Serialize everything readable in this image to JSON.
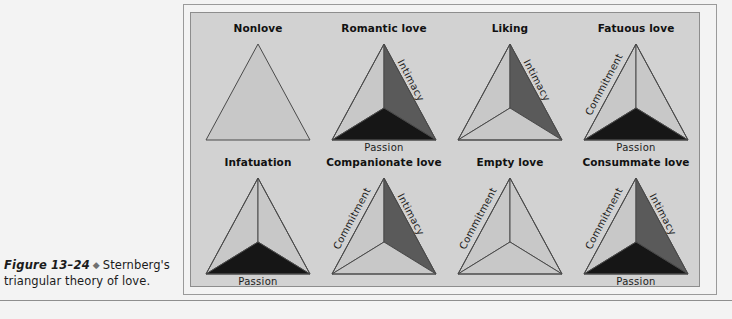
{
  "figure": {
    "caption_label": "Figure 13–24",
    "caption_diamond": "◆",
    "caption_text": "Sternberg's triangular theory of love.",
    "title": "Sternberg's triangular theory of love"
  },
  "colors": {
    "page_background": "#f3f3f3",
    "panel_background": "#d2d2d2",
    "panel_border": "#8d8d8d",
    "outer_frame_border": "#9a9a9a",
    "triangle_stroke": "#4a4a4a",
    "fill_empty": "#c8c8c8",
    "fill_intimacy": "#5a5a5a",
    "fill_passion": "#161616",
    "fill_commitment": "#c8c8c8",
    "label_text": "#1d1d1d",
    "title_text": "#111111",
    "rule": "#8e8e8e"
  },
  "components": {
    "passion": "Passion",
    "intimacy": "Intimacy",
    "commitment": "Commitment"
  },
  "triangles": [
    {
      "id": "nonlove",
      "label": "Nonlove",
      "row": 0,
      "col": 0,
      "passion": false,
      "intimacy": false,
      "commitment": false,
      "show_subdivision": false,
      "labels": []
    },
    {
      "id": "romantic-love",
      "label": "Romantic love",
      "row": 0,
      "col": 1,
      "passion": true,
      "intimacy": true,
      "commitment": false,
      "show_subdivision": true,
      "labels": [
        "Intimacy",
        "Passion"
      ]
    },
    {
      "id": "liking",
      "label": "Liking",
      "row": 0,
      "col": 2,
      "passion": false,
      "intimacy": true,
      "commitment": false,
      "show_subdivision": true,
      "labels": [
        "Intimacy"
      ]
    },
    {
      "id": "fatuous-love",
      "label": "Fatuous love",
      "row": 0,
      "col": 3,
      "passion": true,
      "intimacy": false,
      "commitment": true,
      "show_subdivision": true,
      "labels": [
        "Commitment",
        "Passion"
      ]
    },
    {
      "id": "infatuation",
      "label": "Infatuation",
      "row": 1,
      "col": 0,
      "passion": true,
      "intimacy": false,
      "commitment": false,
      "show_subdivision": true,
      "labels": [
        "Passion"
      ]
    },
    {
      "id": "companionate-love",
      "label": "Companionate love",
      "row": 1,
      "col": 1,
      "passion": false,
      "intimacy": true,
      "commitment": true,
      "show_subdivision": true,
      "labels": [
        "Commitment",
        "Intimacy"
      ]
    },
    {
      "id": "empty-love",
      "label": "Empty love",
      "row": 1,
      "col": 2,
      "passion": false,
      "intimacy": false,
      "commitment": true,
      "show_subdivision": true,
      "labels": [
        "Commitment"
      ]
    },
    {
      "id": "consummate-love",
      "label": "Consummate love",
      "row": 1,
      "col": 3,
      "passion": true,
      "intimacy": true,
      "commitment": true,
      "show_subdivision": true,
      "labels": [
        "Commitment",
        "Intimacy",
        "Passion"
      ]
    }
  ],
  "layout": {
    "cell_width": 124,
    "cell_height": 132,
    "col_origin_x": 196,
    "row_origin_y": 22,
    "row_gap": 134,
    "col_gap": 126
  }
}
